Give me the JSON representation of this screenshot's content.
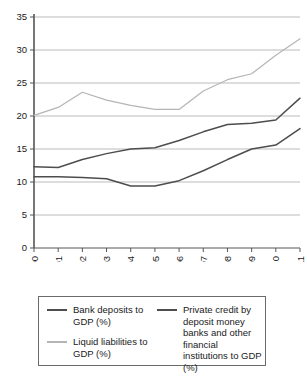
{
  "chart_data": {
    "type": "line",
    "title": "",
    "subtitle": "",
    "xlabel": "",
    "ylabel": "",
    "x": [
      "2000",
      "2001",
      "2002",
      "2003",
      "2004",
      "2005",
      "2006",
      "2007",
      "2008",
      "2009",
      "2010",
      "2011"
    ],
    "categories": [
      "2000",
      "2001",
      "2002",
      "2003",
      "2004",
      "2005",
      "2006",
      "2007",
      "2008",
      "2009",
      "2010",
      "2011"
    ],
    "xlim": [
      0,
      11
    ],
    "ylim": [
      0,
      35
    ],
    "yticks": [
      0,
      5,
      10,
      15,
      20,
      25,
      30,
      35
    ],
    "ytick_labels": [
      "0",
      "5",
      "10",
      "15",
      "20",
      "25",
      "30",
      "35"
    ],
    "grid": "horizontal",
    "legend_position": "bottom",
    "series": [
      {
        "name": "Bank deposits to GDP (%)",
        "color": "#4d4d4d",
        "values": [
          12.3,
          12.2,
          13.4,
          14.3,
          15.0,
          15.2,
          16.3,
          17.6,
          18.7,
          18.9,
          19.4,
          22.7
        ]
      },
      {
        "name": "Liquid liabilities to GDP (%)",
        "color": "#b5b5b5",
        "values": [
          20.1,
          21.3,
          23.6,
          22.4,
          21.6,
          21.0,
          21.0,
          23.8,
          25.5,
          26.4,
          29.2,
          31.7
        ]
      },
      {
        "name": "Private credit by deposit money banks and other financial institutions to GDP (%)",
        "color": "#4d4d4d",
        "values": [
          10.8,
          10.8,
          10.7,
          10.5,
          9.4,
          9.4,
          10.2,
          11.7,
          13.4,
          15.0,
          15.6,
          18.1
        ]
      }
    ]
  },
  "axes": {
    "y_tick_labels": [
      "35",
      "30",
      "25",
      "20",
      "15",
      "10",
      "5",
      "0"
    ],
    "x_tick_labels": [
      "2000",
      "2001",
      "2002",
      "2003",
      "2004",
      "2005",
      "2006",
      "2007",
      "2008",
      "2009",
      "2010",
      "2011"
    ]
  },
  "legend": {
    "entries": [
      {
        "label": "Bank deposits to GDP (%)",
        "color": "#4d4d4d",
        "column": "left"
      },
      {
        "label": "Liquid liabilities to GDP (%)",
        "color": "#b5b5b5",
        "column": "left"
      },
      {
        "label": "Private credit by deposit money banks and other financial institutions to GDP (%)",
        "color": "#4d4d4d",
        "column": "right"
      }
    ]
  },
  "colors": {
    "axis": "#555555",
    "grid": "#a9a9a9",
    "dark_series": "#4d4d4d",
    "light_series": "#b5b5b5",
    "legend_border": "#6b6b6b",
    "background": "#ffffff"
  }
}
